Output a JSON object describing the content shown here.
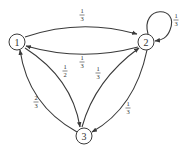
{
  "diagram": {
    "type": "markov-chain-state-diagram",
    "colors": {
      "stroke": "#3a3a3a",
      "text": "#333333",
      "background": "#ffffff"
    },
    "nodes": [
      {
        "id": "1",
        "label": "1"
      },
      {
        "id": "2",
        "label": "2"
      },
      {
        "id": "3",
        "label": "3"
      }
    ],
    "edges": [
      {
        "from": "1",
        "to": "2",
        "num": "1",
        "den": "3"
      },
      {
        "from": "2",
        "to": "1",
        "num": "1",
        "den": "3"
      },
      {
        "from": "2",
        "to": "2",
        "num": "1",
        "den": "3"
      },
      {
        "from": "1",
        "to": "3",
        "num": "1",
        "den": "2"
      },
      {
        "from": "3",
        "to": "2",
        "num": "1",
        "den": "3"
      },
      {
        "from": "2",
        "to": "3",
        "num": "1",
        "den": "3"
      },
      {
        "from": "3",
        "to": "1",
        "num": "2",
        "den": "3"
      }
    ]
  }
}
